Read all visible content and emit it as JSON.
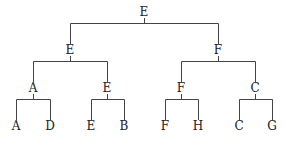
{
  "tree": {
    "root": {
      "label": "E",
      "x": 144,
      "y": 12
    },
    "level2": [
      {
        "label": "E",
        "x": 70,
        "y": 50
      },
      {
        "label": "F",
        "x": 218,
        "y": 50
      }
    ],
    "level3": [
      {
        "label": "A",
        "x": 33,
        "y": 88
      },
      {
        "label": "E",
        "x": 107,
        "y": 88
      },
      {
        "label": "F",
        "x": 181,
        "y": 88
      },
      {
        "label": "C",
        "x": 255,
        "y": 88
      }
    ],
    "leaves": [
      {
        "label": "A",
        "x": 16,
        "y": 126
      },
      {
        "label": "D",
        "x": 50,
        "y": 126
      },
      {
        "label": "E",
        "x": 91,
        "y": 126
      },
      {
        "label": "B",
        "x": 124,
        "y": 126
      },
      {
        "label": "F",
        "x": 165,
        "y": 126
      },
      {
        "label": "H",
        "x": 198,
        "y": 126
      },
      {
        "label": "C",
        "x": 239,
        "y": 126
      },
      {
        "label": "G",
        "x": 272,
        "y": 126
      }
    ]
  }
}
